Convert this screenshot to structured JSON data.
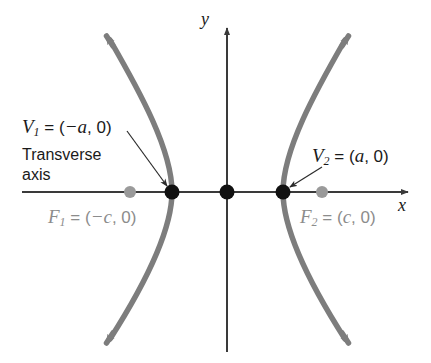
{
  "figure": {
    "type": "hyperbola-diagram",
    "title_text": "",
    "axes": {
      "x_label": "x",
      "y_label": "y",
      "x_axis_y": 192,
      "y_axis_x": 227,
      "origin": {
        "x": 227,
        "y": 192
      }
    },
    "colors": {
      "curve": "#7d7d7d",
      "axis": "#3a3a3a",
      "vertex_dot": "#111111",
      "focus_dot": "#9a9a9a",
      "label_dark": "#1a1a1a",
      "label_gray": "#8c8c8c",
      "background": "#ffffff"
    },
    "labels": {
      "vertex_left": {
        "var": "V",
        "sub": "1",
        "eq": " = (",
        "coord": "−a",
        "rest": ", 0)"
      },
      "vertex_right": {
        "var": "V",
        "sub": "2",
        "eq": " = (",
        "coord": "a",
        "rest": ", 0)"
      },
      "focus_left": {
        "var": "F",
        "sub": "1",
        "eq": " = (",
        "coord": "−c",
        "rest": ", 0)"
      },
      "focus_right": {
        "var": "F",
        "sub": "2",
        "eq": " = (",
        "coord": "c",
        "rest": ", 0)"
      },
      "transverse_line1": "Transverse",
      "transverse_line2": "axis"
    },
    "points": [
      {
        "name": "vertex-left",
        "label": "V1",
        "coords": "(-a, 0)",
        "px": 172,
        "py": 192,
        "kind": "vertex"
      },
      {
        "name": "vertex-right",
        "label": "V2",
        "coords": "(a, 0)",
        "px": 283,
        "py": 192,
        "kind": "vertex"
      },
      {
        "name": "center",
        "label": "O",
        "coords": "(0, 0)",
        "px": 227,
        "py": 192,
        "kind": "center"
      },
      {
        "name": "focus-left",
        "label": "F1",
        "coords": "(-c, 0)",
        "px": 130,
        "py": 192,
        "kind": "focus"
      },
      {
        "name": "focus-right",
        "label": "F2",
        "coords": "(c, 0)",
        "px": 322,
        "py": 192,
        "kind": "focus"
      }
    ]
  }
}
